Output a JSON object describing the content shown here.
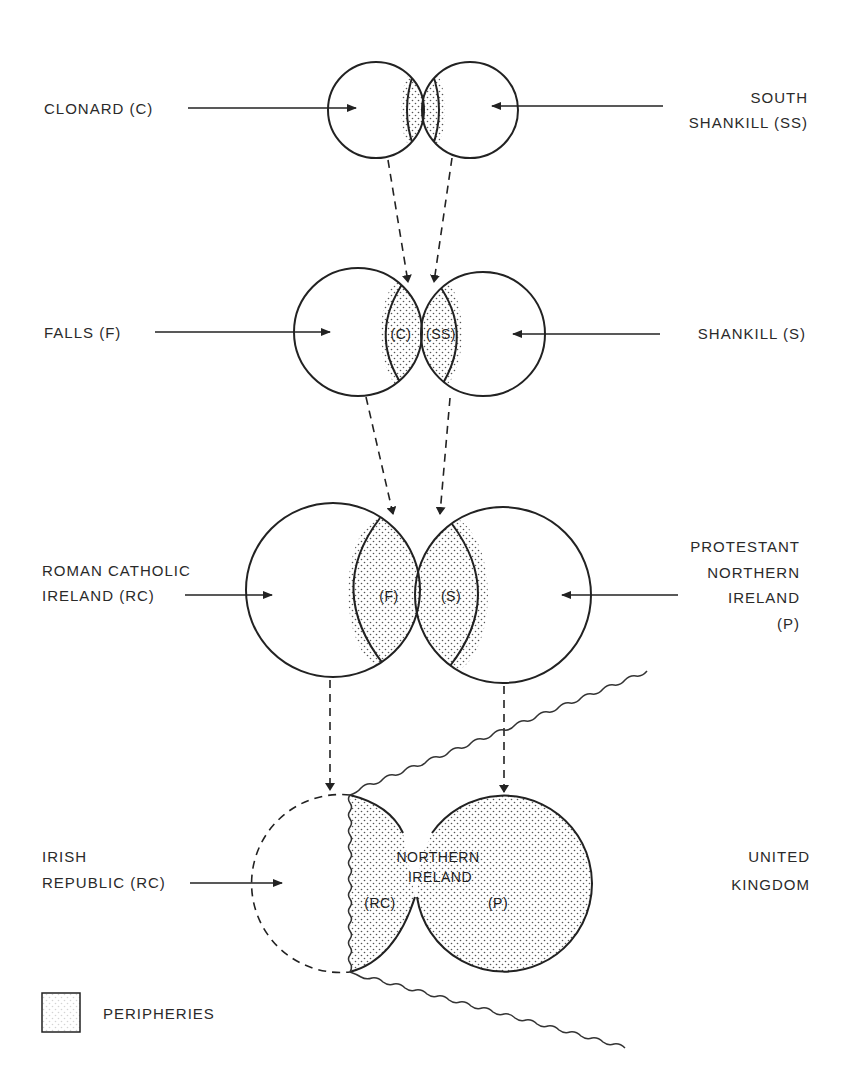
{
  "diagram": {
    "levels": [
      {
        "left": {
          "lines": [
            "CLONARD (C)"
          ]
        },
        "right": {
          "lines": [
            "SOUTH",
            "SHANKILL (SS)"
          ]
        }
      },
      {
        "left": {
          "lines": [
            "FALLS (F)"
          ]
        },
        "right": {
          "lines": [
            "SHANKILL (S)"
          ]
        },
        "overlaps": [
          "(C)",
          "(SS)"
        ]
      },
      {
        "left": {
          "lines": [
            "ROMAN CATHOLIC",
            "IRELAND (RC)"
          ]
        },
        "right": {
          "lines": [
            "PROTESTANT",
            "NORTHERN",
            "IRELAND",
            "(P)"
          ]
        },
        "overlaps": [
          "(F)",
          "(S)"
        ]
      },
      {
        "left": {
          "lines": [
            "IRISH",
            "REPUBLIC (RC)"
          ]
        },
        "right": {
          "lines": [
            "UNITED",
            "KINGDOM"
          ]
        },
        "center": {
          "lines": [
            "NORTHERN",
            "IRELAND"
          ]
        },
        "overlaps": [
          "(RC)",
          "(P)"
        ]
      }
    ],
    "legend": {
      "label": "PERIPHERIES",
      "swatch": "dotted-box"
    },
    "colors": {
      "stroke": "#222222",
      "background": "#ffffff",
      "stipple": "#555555"
    }
  }
}
